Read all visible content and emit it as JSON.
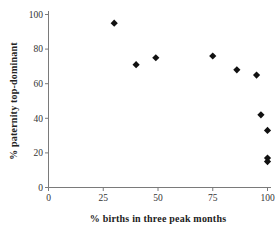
{
  "chart_data": {
    "type": "scatter",
    "title": "",
    "xlabel": "% births in three peak months",
    "ylabel": "% paternity top-dominant",
    "xlim": [
      0,
      100
    ],
    "ylim": [
      0,
      100
    ],
    "x_ticks": [
      0,
      25,
      50,
      75,
      100
    ],
    "y_ticks": [
      0,
      20,
      40,
      60,
      80,
      100
    ],
    "grid": false,
    "legend": "none",
    "marker": "diamond",
    "colors": {
      "marker": "#111111",
      "axis": "#7a7a7a",
      "tick_text": "#333333",
      "title_text": "#222222",
      "background": "#ffffff"
    },
    "points": [
      {
        "x": 30,
        "y": 95
      },
      {
        "x": 40,
        "y": 71
      },
      {
        "x": 49,
        "y": 75
      },
      {
        "x": 75,
        "y": 76
      },
      {
        "x": 86,
        "y": 68
      },
      {
        "x": 95,
        "y": 65
      },
      {
        "x": 97,
        "y": 42
      },
      {
        "x": 100,
        "y": 33
      },
      {
        "x": 100,
        "y": 17
      },
      {
        "x": 100,
        "y": 15
      }
    ]
  }
}
